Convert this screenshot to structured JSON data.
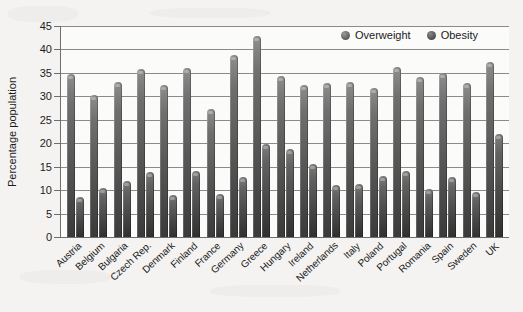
{
  "chart_data": {
    "type": "bar",
    "title": "",
    "xlabel": "",
    "ylabel": "Percentage population",
    "ylim": [
      0,
      45
    ],
    "ytick_step": 5,
    "yticks": [
      "45",
      "40",
      "35",
      "30",
      "25",
      "20",
      "15",
      "10",
      "5",
      "0"
    ],
    "grid": true,
    "legend_position": "top-right",
    "categories": [
      "Austria",
      "Belgium",
      "Bulgaria",
      "Czech Rep.",
      "Denmark",
      "Finland",
      "France",
      "Germany",
      "Greece",
      "Hungary",
      "Ireland",
      "Netherlands",
      "Italy",
      "Poland",
      "Portugal",
      "Romania",
      "Spain",
      "Sweden",
      "UK"
    ],
    "series": [
      {
        "name": "Overweight",
        "color": "#5a5a5a",
        "values": [
          34.7,
          30.3,
          33.1,
          35.8,
          32.4,
          36.0,
          27.2,
          38.9,
          42.8,
          34.4,
          32.4,
          32.8,
          33.0,
          31.8,
          36.2,
          34.2,
          34.9,
          32.8,
          37.3
        ]
      },
      {
        "name": "Obesity",
        "color": "#3d3d3d",
        "values": [
          8.6,
          10.5,
          12.0,
          13.9,
          9.0,
          14.0,
          9.1,
          12.9,
          19.9,
          18.8,
          15.5,
          11.2,
          11.4,
          13.1,
          14.0,
          10.3,
          12.9,
          9.7,
          22.0
        ]
      }
    ]
  },
  "legend": {
    "items": [
      {
        "label": "Overweight"
      },
      {
        "label": "Obesity"
      }
    ]
  }
}
